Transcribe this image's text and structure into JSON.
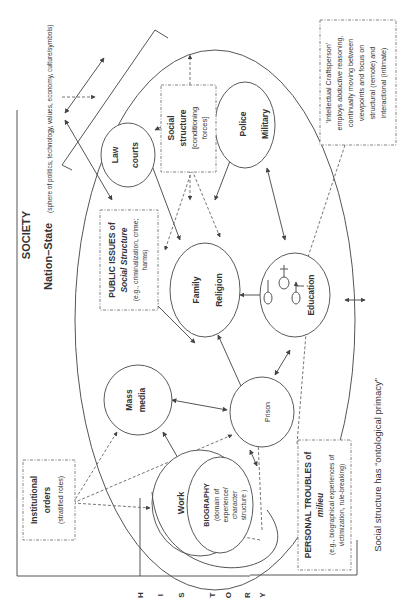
{
  "diagram": {
    "orientation": "rotated-90-ccw",
    "title": "SOCIETY",
    "nation_state": {
      "label": "Nation–State",
      "description": "(sphere of politics, technology, values, economy, culture/symbols)"
    },
    "history_label": [
      "H",
      "I",
      "S",
      "T",
      "O",
      "R",
      "Y"
    ],
    "footer_note": "Social structure has “ontological primacy”",
    "boxes": {
      "social_structure": {
        "line1": "Social",
        "line2": "structure",
        "line3": "[conditioning",
        "line4": "forces]"
      },
      "craftsperson": {
        "line1": "‘Intellectual Craftsperson’",
        "line2_pre": "employs ",
        "line2_em": "abductive",
        "line2_post": " reasoning,",
        "line3": "continually moving between",
        "line4": "viewpoints and focus on",
        "line5": "structural (remote) and",
        "line6": "interactional (intimate)"
      },
      "public_issues": {
        "line1": "PUBLIC ISSUES of",
        "line2": "Social Structure",
        "line3": "(e.g., criminalization, crime;",
        "line4": "harms)"
      },
      "institutional_orders": {
        "line1": "Institutional",
        "line2": "orders",
        "line3": "(stratified roles)"
      },
      "personal_troubles": {
        "line1": "PERSONAL TROUBLES of",
        "line2": "milieu",
        "line3": "(e.g., biographical experiences of",
        "line4": "victimization, rule-breaking)"
      }
    },
    "nodes": {
      "law_courts": {
        "line1": "Law",
        "line2": "courts"
      },
      "police_military": {
        "line1": "Police",
        "line2": "Military"
      },
      "family_religion": {
        "line1": "Family",
        "line2": "Religion"
      },
      "education": {
        "line1": "Education"
      },
      "mass_media": {
        "line1": "Mass",
        "line2": "media"
      },
      "prison": {
        "line1": "Prison"
      },
      "work": {
        "line1": "Work"
      },
      "biography": {
        "line1": "BIOGRAPHY",
        "line2": "(domain of",
        "line3": "experience/",
        "line4": "character",
        "line5": "structure )"
      }
    },
    "edges": [
      [
        "nation_state",
        "law_courts"
      ],
      [
        "nation_state",
        "mass_media"
      ],
      [
        "law_courts",
        "police_military"
      ],
      [
        "law_courts",
        "family_religion"
      ],
      [
        "police_military",
        "family_religion"
      ],
      [
        "police_military",
        "education"
      ],
      [
        "family_religion",
        "education"
      ],
      [
        "family_religion",
        "mass_media"
      ],
      [
        "family_religion",
        "prison"
      ],
      [
        "mass_media",
        "prison"
      ],
      [
        "mass_media",
        "work"
      ],
      [
        "prison",
        "work"
      ],
      [
        "prison",
        "education"
      ],
      [
        "education",
        "society_boundary"
      ]
    ],
    "colors": {
      "line": "#555555",
      "text": "#333333",
      "background": "#ffffff"
    }
  }
}
